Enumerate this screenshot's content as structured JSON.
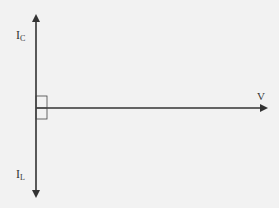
{
  "diagram": {
    "title": "",
    "labels": {
      "ic_main": "I",
      "ic_sub": "C",
      "il_main": "I",
      "il_sub": "L",
      "v": "V"
    },
    "vectors": [
      {
        "name": "I_C",
        "direction": "up"
      },
      {
        "name": "I_L",
        "direction": "down"
      },
      {
        "name": "V",
        "direction": "right"
      }
    ],
    "right_angle_marker": true,
    "colors": {
      "line": "#333333",
      "background": "#f2f2f2"
    }
  }
}
